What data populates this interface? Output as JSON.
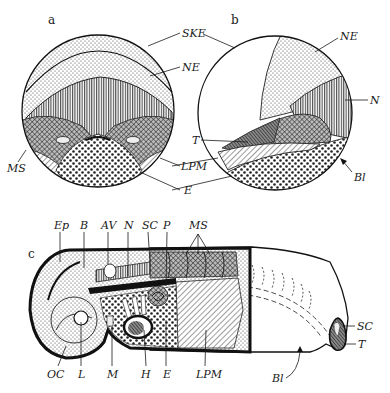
{
  "figure": {
    "panels": [
      {
        "id": "a",
        "label": "a",
        "structure_labels": [
          {
            "key": "SKE",
            "text": "SKE"
          },
          {
            "key": "NE",
            "text": "NE"
          },
          {
            "key": "MS",
            "text": "MS"
          },
          {
            "key": "LPM",
            "text": "LPM"
          },
          {
            "key": "E",
            "text": "E"
          }
        ]
      },
      {
        "id": "b",
        "label": "b",
        "structure_labels": [
          {
            "key": "NE",
            "text": "NE"
          },
          {
            "key": "N",
            "text": "N"
          },
          {
            "key": "T",
            "text": "T"
          },
          {
            "key": "Bl",
            "text": "Bl"
          }
        ]
      },
      {
        "id": "c",
        "label": "c",
        "top_labels": [
          {
            "key": "Ep",
            "text": "Ep"
          },
          {
            "key": "B",
            "text": "B"
          },
          {
            "key": "AV",
            "text": "AV"
          },
          {
            "key": "N",
            "text": "N"
          },
          {
            "key": "SC",
            "text": "SC"
          },
          {
            "key": "P",
            "text": "P"
          },
          {
            "key": "MS",
            "text": "MS"
          }
        ],
        "bottom_labels": [
          {
            "key": "OC",
            "text": "OC"
          },
          {
            "key": "L",
            "text": "L"
          },
          {
            "key": "M",
            "text": "M"
          },
          {
            "key": "H",
            "text": "H"
          },
          {
            "key": "E",
            "text": "E"
          },
          {
            "key": "LPM",
            "text": "LPM"
          },
          {
            "key": "Bl",
            "text": "Bl"
          }
        ],
        "right_labels": [
          {
            "key": "SC",
            "text": "SC"
          },
          {
            "key": "T",
            "text": "T"
          }
        ]
      }
    ],
    "colors": {
      "ink": "#1a1a1a",
      "paper": "#ffffff"
    }
  }
}
